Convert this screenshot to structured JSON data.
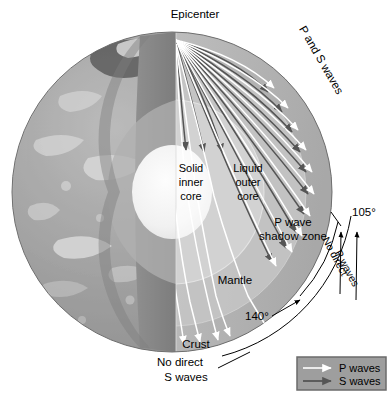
{
  "figure": {
    "type": "diagram"
  },
  "labels": {
    "epicenter": "Epicenter",
    "p_and_s_waves": "P and S waves",
    "solid_inner_core": [
      "Solid",
      "inner",
      "core"
    ],
    "liquid_outer_core": [
      "Liquid",
      "outer",
      "core"
    ],
    "p_wave_shadow_zone": [
      "P wave",
      "shadow zone"
    ],
    "mantle": "Mantle",
    "crust": "Crust",
    "no_direct_s_waves": [
      "No direct",
      "S waves"
    ],
    "no_direct_p_waves": [
      "No direct",
      "P waves"
    ],
    "angle_105": "105°",
    "angle_140": "140°"
  },
  "legend": {
    "items": [
      {
        "label": "P waves",
        "color": "#ffffff",
        "key": "p-wave"
      },
      {
        "label": "S waves",
        "color": "#4c4c4c",
        "key": "s-wave"
      }
    ]
  },
  "colors": {
    "background": "#ffffff",
    "globe_surface": "#a6a6a6",
    "crust_band": "#8f8f8f",
    "mantle_upper": "#9a9a9a",
    "mantle_cut": "#b4b4b4",
    "mantle_light": "#c2c2c2",
    "outer_core": "#cfcfcf",
    "inner_core": "#f2f2f2",
    "cut_face_dark": "#7d7d7d",
    "p_wave_ray": "#ffffff",
    "s_wave_ray": "#555555",
    "leader_line": "#000000",
    "legend_fill": "#9e9e9e",
    "legend_border": "#6b6b6b"
  },
  "geometry": {
    "globe_center_x": 172,
    "globe_center_y": 192,
    "globe_radius": 160,
    "epicenter_x": 176,
    "epicenter_y": 40,
    "shadow_zone_start_deg": 105,
    "shadow_zone_end_deg": 140
  }
}
